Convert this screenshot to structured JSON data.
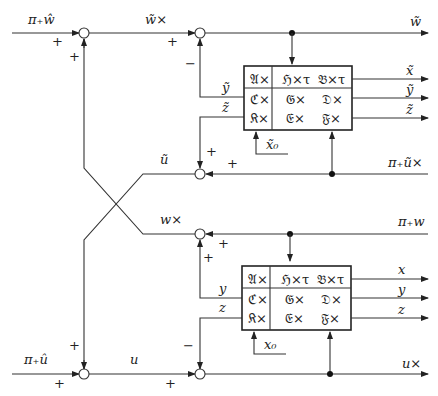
{
  "diagram": {
    "type": "block-diagram",
    "summing_junctions": [
      {
        "id": "s1",
        "inputs": [
          {
            "from": "left",
            "sign": "+"
          },
          {
            "from": "below",
            "sign": "+"
          }
        ]
      },
      {
        "id": "s2",
        "inputs": [
          {
            "from": "left",
            "sign": "+"
          },
          {
            "from": "below",
            "sign": "−"
          }
        ]
      },
      {
        "id": "s3",
        "inputs": [
          {
            "from": "right",
            "sign": "+"
          },
          {
            "from": "above",
            "sign": "+"
          }
        ]
      },
      {
        "id": "s4",
        "inputs": [
          {
            "from": "right",
            "sign": "+"
          },
          {
            "from": "below",
            "sign": "+"
          }
        ]
      },
      {
        "id": "s5",
        "inputs": [
          {
            "from": "left",
            "sign": "+"
          },
          {
            "from": "above",
            "sign": "+"
          }
        ]
      },
      {
        "id": "s6",
        "inputs": [
          {
            "from": "left",
            "sign": "+"
          },
          {
            "from": "above",
            "sign": "−"
          }
        ]
      }
    ],
    "signals": {
      "top_in": "π₊ŵ",
      "top_mid": "w̃×",
      "top_out": "w̃",
      "tilde_x": "x̃",
      "tilde_y": "ỹ",
      "tilde_z": "z̃",
      "tilde_y_in": "ỹ",
      "tilde_z_in": "z̃",
      "tilde_x0": "x̃₀",
      "tilde_u": "ũ",
      "tilde_u_right": "π₊ũ×",
      "w_times": "w×",
      "pi_w": "π₊w",
      "x": "x",
      "y": "y",
      "z": "z",
      "y_in": "y",
      "z_in": "z",
      "x0": "x₀",
      "bottom_in": "π₊û",
      "u": "u",
      "u_out": "u×"
    },
    "signs": {
      "s1_left": "+",
      "s1_below": "+",
      "s2_left": "+",
      "s2_below": "−",
      "s3_above": "+",
      "s3_right": "+",
      "s4_right": "+",
      "s4_below": "+",
      "s5_above": "+",
      "s5_left": "+",
      "s6_above": "−",
      "s6_left": "+"
    },
    "upper_block": {
      "rows": [
        [
          "𝔄×",
          "ℌ×τ",
          "𝔅×τ"
        ],
        [
          "ℭ×",
          "𝔊×",
          "𝔇×"
        ],
        [
          "𝔎×",
          "𝔈×",
          "𝔉×"
        ]
      ]
    },
    "lower_block": {
      "rows": [
        [
          "𝔄×",
          "ℌ×τ",
          "𝔅×τ"
        ],
        [
          "ℭ×",
          "𝔊×",
          "𝔇×"
        ],
        [
          "𝔎×",
          "𝔈×",
          "𝔉×"
        ]
      ]
    }
  }
}
